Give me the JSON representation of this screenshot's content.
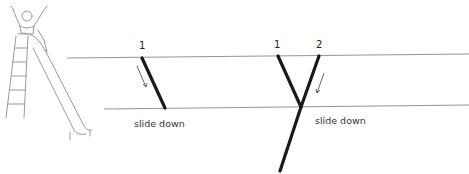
{
  "diagram": {
    "type": "tree-diagram-illustration",
    "illustration": {
      "name": "child-on-slide",
      "description": "Sketch of a child with arms raised at the top of a playground slide"
    },
    "left_panel": {
      "branch_label": "1",
      "caption": "slide down",
      "arrow": "down-along-branch"
    },
    "right_panel": {
      "branch_labels": [
        "1",
        "2"
      ],
      "caption": "slide down",
      "arrow": "down-along-branch-2"
    },
    "colors": {
      "stroke": "#1a1a1a",
      "guide_line": "#888888",
      "arrow": "#555555",
      "sketch": "#9a9a9a"
    }
  }
}
